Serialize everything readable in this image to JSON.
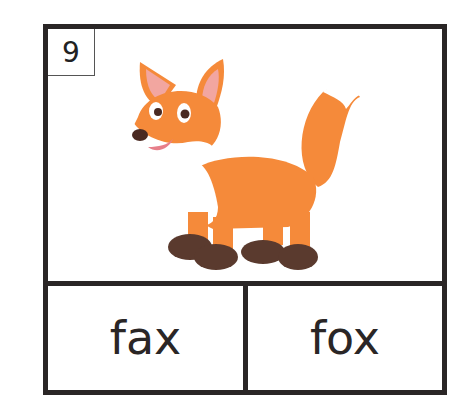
{
  "card": {
    "number": "9",
    "image": {
      "subject": "fox-illustration",
      "alt": "cartoon fox"
    },
    "choices": [
      {
        "label": "fax"
      },
      {
        "label": "fox"
      }
    ]
  },
  "colors": {
    "border": "#2a2626",
    "fox_orange": "#f58a3a",
    "fox_paws": "#5a3a2e",
    "ear_inner": "#f2a6a0"
  }
}
